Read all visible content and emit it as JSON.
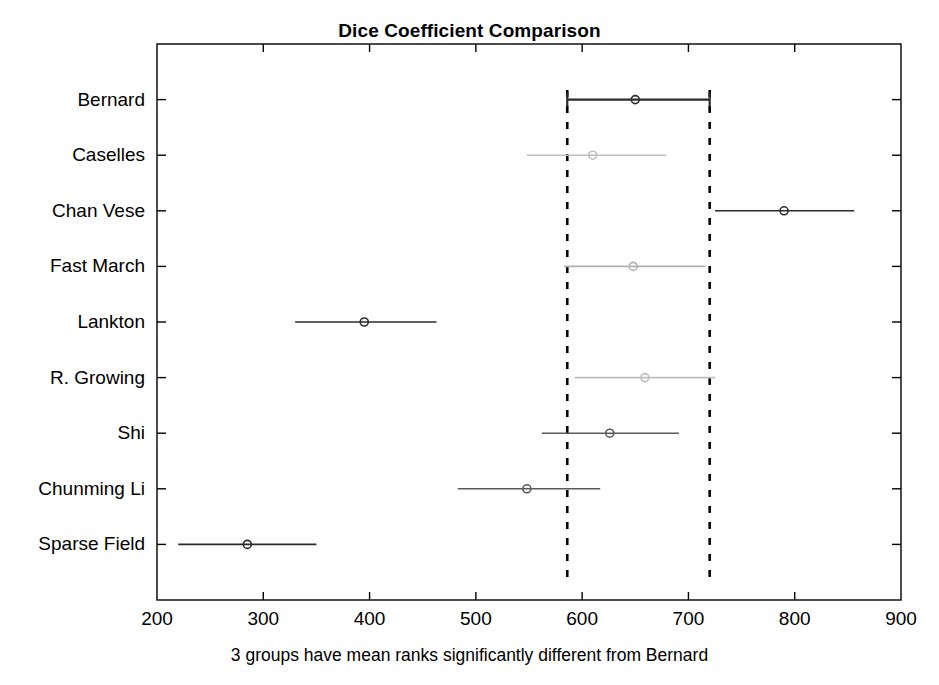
{
  "chart_data": {
    "type": "scatter",
    "title": "Dice Coefficient Comparison",
    "xlabel": "3 groups have mean ranks significantly different from Bernard",
    "ylabel": "",
    "xlim": [
      200,
      900
    ],
    "xticks": [
      200,
      300,
      400,
      500,
      600,
      700,
      800,
      900
    ],
    "xtick_labels": [
      "200",
      "300",
      "400",
      "500",
      "600",
      "700",
      "800",
      "900"
    ],
    "grid": false,
    "legend": null,
    "reference_group": "Bernard",
    "reference_interval": [
      586,
      720
    ],
    "comparison_lines": [
      586,
      720
    ],
    "categories": [
      "Bernard",
      "Caselles",
      "Chan Vese",
      "Fast March",
      "Lankton",
      "R. Growing",
      "Shi",
      "Chunming Li",
      "Sparse Field"
    ],
    "series": [
      {
        "name": "Mean rank with 95% confidence interval",
        "points": [
          {
            "group": "Bernard",
            "mean": 650,
            "low": 586,
            "high": 720,
            "color": "#2b2b2b",
            "significant": false,
            "is_reference": true
          },
          {
            "group": "Caselles",
            "mean": 610,
            "low": 548,
            "high": 679,
            "color": "#bdbdbd",
            "significant": false,
            "is_reference": false
          },
          {
            "group": "Chan Vese",
            "mean": 790,
            "low": 725,
            "high": 856,
            "color": "#2b2b2b",
            "significant": true,
            "is_reference": false
          },
          {
            "group": "Fast March",
            "mean": 648,
            "low": 583,
            "high": 716,
            "color": "#b0b0b0",
            "significant": false,
            "is_reference": false
          },
          {
            "group": "Lankton",
            "mean": 395,
            "low": 330,
            "high": 463,
            "color": "#2b2b2b",
            "significant": true,
            "is_reference": false
          },
          {
            "group": "R. Growing",
            "mean": 659,
            "low": 593,
            "high": 725,
            "color": "#bdbdbd",
            "significant": false,
            "is_reference": false
          },
          {
            "group": "Shi",
            "mean": 626,
            "low": 562,
            "high": 691,
            "color": "#5a5a5a",
            "significant": false,
            "is_reference": false
          },
          {
            "group": "Chunming Li",
            "mean": 548,
            "low": 483,
            "high": 617,
            "color": "#5a5a5a",
            "significant": false,
            "is_reference": false
          },
          {
            "group": "Sparse Field",
            "mean": 285,
            "low": 220,
            "high": 350,
            "color": "#2b2b2b",
            "significant": true,
            "is_reference": false
          }
        ]
      }
    ],
    "colors": {
      "significant": "#2b2b2b",
      "not_significant": "#bdbdbd",
      "reference": "#2b2b2b",
      "axis": "#000000",
      "comparison_line": "#000000",
      "background": "#ffffff"
    }
  }
}
